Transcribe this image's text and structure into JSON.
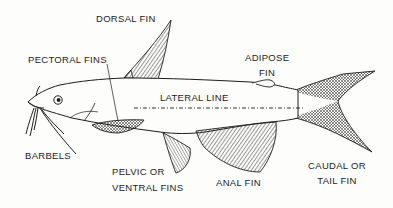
{
  "diagram": {
    "labels": {
      "dorsal_fin": "DORSAL FIN",
      "pectoral_fins": "PECTORAL FINS",
      "adipose_fin_line1": "ADIPOSE",
      "adipose_fin_line2": "FIN",
      "lateral_line": "LATERAL LINE",
      "barbels": "BARBELS",
      "pelvic_fins_line1": "PELVIC OR",
      "pelvic_fins_line2": "VENTRAL FINS",
      "anal_fin": "ANAL FIN",
      "caudal_fin_line1": "CAUDAL OR",
      "caudal_fin_line2": "TAIL FIN"
    },
    "colors": {
      "ink": "#1c1c1c",
      "background": "#fdfdfc"
    }
  }
}
